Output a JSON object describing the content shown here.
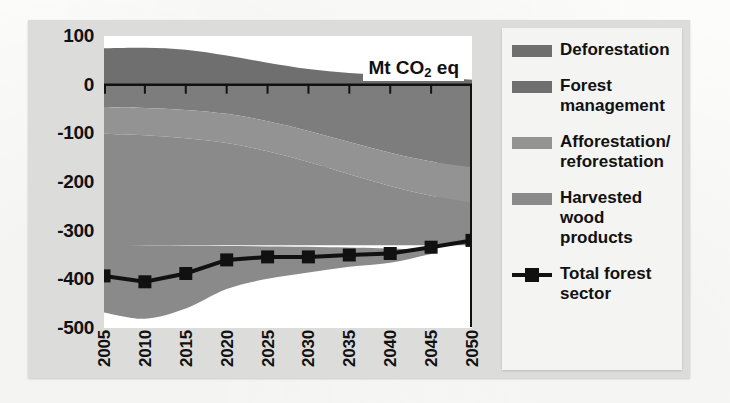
{
  "figure": {
    "unit_badge": "Mt CO",
    "unit_badge_sub": "2",
    "unit_badge_tail": " eq"
  },
  "legend": {
    "items": [
      {
        "label": "Deforestation",
        "color": "#6f6f6f",
        "type": "area"
      },
      {
        "label": "Forest management",
        "color": "#6f6f6f",
        "type": "area"
      },
      {
        "label": "Afforestation/ reforestation",
        "color": "#939393",
        "type": "area"
      },
      {
        "label": "Harvested wood products",
        "color": "#8a8a8a",
        "type": "area"
      },
      {
        "label": "Total forest sector",
        "color": "#111111",
        "type": "line"
      }
    ]
  },
  "chart_data": {
    "type": "area",
    "title": "",
    "subtitle": "",
    "xlabel": "",
    "ylabel": "Mt CO2 eq",
    "annotations": [
      "Mt CO2 eq"
    ],
    "grid": false,
    "legend_position": "right",
    "stacked": true,
    "x": [
      2005,
      2010,
      2015,
      2020,
      2025,
      2030,
      2035,
      2040,
      2045,
      2050
    ],
    "xlim": [
      2005,
      2050
    ],
    "ylim": [
      -500,
      100
    ],
    "yticks": [
      100,
      0,
      -100,
      -200,
      -300,
      -400,
      -500
    ],
    "xticks": [
      "2005",
      "2010",
      "2015",
      "2020",
      "2025",
      "2030",
      "2035",
      "2040",
      "2045",
      "2050"
    ],
    "series": [
      {
        "name": "Deforestation",
        "color": "#6f6f6f",
        "values": [
          75,
          76,
          72,
          60,
          45,
          32,
          24,
          19,
          14,
          10
        ]
      },
      {
        "name": "Forest management",
        "color": "#7d7d7d",
        "values": [
          -46,
          -48,
          -52,
          -60,
          -75,
          -95,
          -118,
          -140,
          -158,
          -170
        ]
      },
      {
        "name": "Afforestation/reforestation",
        "color": "#939393",
        "values": [
          -55,
          -56,
          -58,
          -60,
          -62,
          -64,
          -66,
          -68,
          -70,
          -72
        ]
      },
      {
        "name": "Harvested wood products",
        "color": "#8a8a8a",
        "values": [
          -367,
          -377,
          -350,
          -300,
          -262,
          -227,
          -190,
          -158,
          -120,
          -88
        ]
      },
      {
        "name": "Total forest sector",
        "color": "#111111",
        "type": "line",
        "values": [
          -393,
          -405,
          -388,
          -360,
          -354,
          -354,
          -350,
          -347,
          -334,
          -320
        ]
      }
    ]
  }
}
